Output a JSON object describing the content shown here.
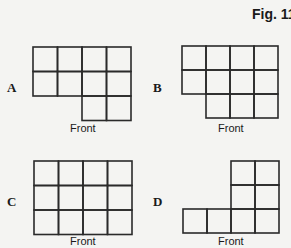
{
  "figure": {
    "title": "Fig. 11",
    "front_label": "Front",
    "options": [
      {
        "label": "A",
        "description": "4 columns x 2 rows full, plus bottom row with 2 cells on right",
        "rows": [
          [
            1,
            1,
            1,
            1
          ],
          [
            1,
            1,
            1,
            1
          ],
          [
            0,
            0,
            1,
            1
          ]
        ],
        "origin": [
          33,
          47
        ],
        "cell": 24.5
      },
      {
        "label": "B",
        "description": "4 columns x 2 rows full, plus bottom row with 3 cells on right",
        "rows": [
          [
            1,
            1,
            1,
            1
          ],
          [
            1,
            1,
            1,
            1
          ],
          [
            0,
            1,
            1,
            1
          ]
        ],
        "origin": [
          182,
          46
        ],
        "cell": 24
      },
      {
        "label": "C",
        "description": "Full 4 columns x 3 rows",
        "rows": [
          [
            1,
            1,
            1,
            1
          ],
          [
            1,
            1,
            1,
            1
          ],
          [
            1,
            1,
            1,
            1
          ]
        ],
        "origin": [
          34,
          161
        ],
        "cell": 24.5
      },
      {
        "label": "D",
        "description": "Right 2 columns x 3 rows, plus bottom row extended to 4 cells",
        "rows": [
          [
            0,
            0,
            1,
            1
          ],
          [
            0,
            0,
            1,
            1
          ],
          [
            1,
            1,
            1,
            1
          ]
        ],
        "origin": [
          183,
          161
        ],
        "cell": 24
      }
    ]
  }
}
